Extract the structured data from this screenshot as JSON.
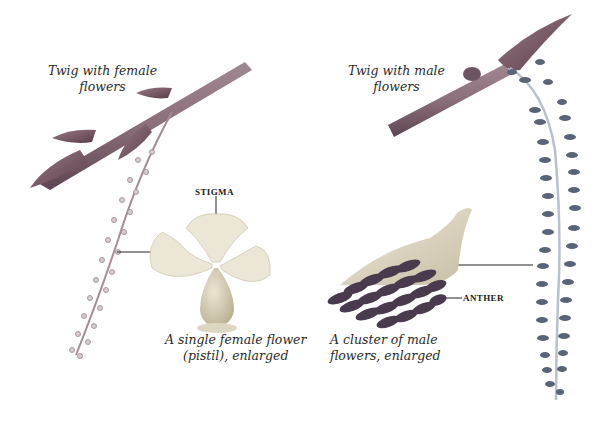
{
  "illustration": {
    "female_twig_caption": [
      "Twig with female",
      "flowers"
    ],
    "male_twig_caption": [
      "Twig with male",
      "flowers"
    ],
    "female_flower_caption": [
      "A single female flower",
      "(pistil), enlarged"
    ],
    "male_cluster_caption": [
      "A cluster of male",
      "flowers, enlarged"
    ],
    "stigma_label": "STIGMA",
    "anther_label": "ANTHER"
  },
  "colors": {
    "twig": "#8a6e7a",
    "twig_shadow": "#5e4452",
    "bud": "#7a5464",
    "female_catkin": "#a58c94",
    "pistil_petal": "#ebe6d6",
    "pistil_ovary": "#c9c0a6",
    "male_catkin": "#5a6478",
    "anther": "#4a3a4e",
    "male_cluster_base": "#d9d2c0",
    "leader_line": "#222222"
  }
}
